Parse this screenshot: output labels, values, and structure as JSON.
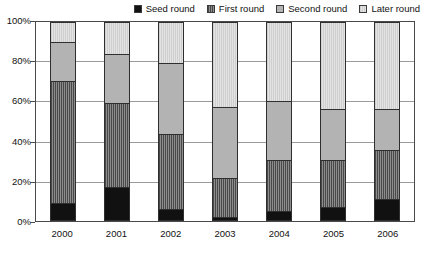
{
  "chart_data": {
    "type": "bar",
    "stacked": true,
    "normalized": true,
    "title": "",
    "xlabel": "",
    "ylabel": "",
    "categories": [
      "2000",
      "2001",
      "2002",
      "2003",
      "2004",
      "2005",
      "2006"
    ],
    "ylim": [
      0,
      100
    ],
    "ytick_labels": [
      "0%",
      "20%",
      "40%",
      "60%",
      "80%",
      "100%"
    ],
    "yticks": [
      0,
      20,
      40,
      60,
      80,
      100
    ],
    "grid": true,
    "legend_position": "top-right",
    "series": [
      {
        "name": "Seed round",
        "swatch": "seed",
        "color": "#111111",
        "values": [
          8,
          16,
          5,
          1,
          4,
          6,
          10
        ]
      },
      {
        "name": "First round",
        "swatch": "first",
        "color": "#8d8d8d",
        "values": [
          62,
          43,
          38,
          20,
          26,
          24,
          25
        ]
      },
      {
        "name": "Second round",
        "swatch": "second",
        "color": "#b3b3b3",
        "values": [
          20,
          25,
          36,
          36,
          30,
          26,
          21
        ]
      },
      {
        "name": "Later round",
        "swatch": "later",
        "color": "#e3e3e3",
        "values": [
          10,
          16,
          21,
          43,
          40,
          44,
          44
        ]
      }
    ],
    "cumulative_tops": {
      "2000": [
        8,
        70,
        90,
        100
      ],
      "2001": [
        16,
        59,
        84,
        100
      ],
      "2002": [
        5,
        43,
        79,
        100
      ],
      "2003": [
        1,
        21,
        57,
        100
      ],
      "2004": [
        4,
        30,
        60,
        100
      ],
      "2005": [
        6,
        30,
        56,
        100
      ],
      "2006": [
        10,
        35,
        56,
        100
      ]
    }
  }
}
